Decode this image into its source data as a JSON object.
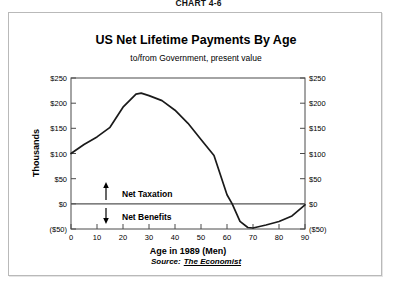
{
  "chart_number": "CHART 4-6",
  "header": {
    "title": "US Net Lifetime Payments By Age",
    "subtitle": "to/from Government, present value"
  },
  "source": {
    "label": "Source:",
    "name": "The Economist"
  },
  "annotations": {
    "above_zero": "Net Taxation",
    "below_zero": "Net Benefits",
    "up_arrow": "↑",
    "down_arrow": "↓"
  },
  "axes": {
    "left_title": "Thousands",
    "right_title": "Thousands",
    "x_title": "Age in 1989 (Men)",
    "y_ticks": [
      "$250",
      "$200",
      "$150",
      "$100",
      "$50",
      "$0",
      "($50)"
    ],
    "x_ticks": [
      "0",
      "10",
      "20",
      "30",
      "40",
      "50",
      "60",
      "70",
      "80",
      "90"
    ]
  },
  "chart_data": {
    "type": "line",
    "title": "US Net Lifetime Payments By Age",
    "subtitle": "to/from Government, present value",
    "xlabel": "Age in 1989 (Men)",
    "ylabel": "Thousands",
    "xlim": [
      0,
      90
    ],
    "ylim": [
      -50,
      250
    ],
    "ytick_values": [
      250,
      200,
      150,
      100,
      50,
      0,
      -50
    ],
    "ytick_labels": [
      "$250",
      "$200",
      "$150",
      "$100",
      "$50",
      "$0",
      "($50)"
    ],
    "xtick_values": [
      0,
      10,
      20,
      30,
      40,
      50,
      60,
      70,
      80,
      90
    ],
    "grid": false,
    "legend": false,
    "zero_line": 0,
    "units": "thousands of dollars, present value",
    "series": [
      {
        "name": "Net lifetime payments to/from government",
        "color": "#1a1a1a",
        "x": [
          0,
          5,
          10,
          15,
          20,
          25,
          27,
          30,
          35,
          40,
          45,
          50,
          55,
          60,
          62,
          65,
          68,
          70,
          75,
          80,
          85,
          90
        ],
        "values": [
          100,
          118,
          133,
          152,
          192,
          218,
          220,
          215,
          205,
          186,
          160,
          128,
          96,
          18,
          0,
          -35,
          -47,
          -48,
          -42,
          -35,
          -24,
          -2
        ]
      }
    ],
    "annotations": [
      {
        "text": "Net Taxation",
        "region": "above zero line",
        "arrow": "up"
      },
      {
        "text": "Net Benefits",
        "region": "below zero line",
        "arrow": "down"
      }
    ]
  }
}
